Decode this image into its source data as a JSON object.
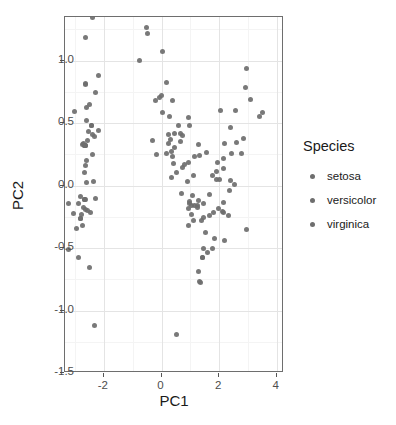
{
  "chart_data": {
    "type": "scatter",
    "title": "",
    "xlabel": "PC1",
    "ylabel": "PC2",
    "xlim": [
      -3.35,
      4.25
    ],
    "ylim": [
      -1.5,
      1.35
    ],
    "xticks": [
      "-2",
      "0",
      "2",
      "4"
    ],
    "xtick_values": [
      -2,
      0,
      2,
      4
    ],
    "yticks": [
      "1.0",
      "0.5",
      "0.0",
      "-0.5",
      "-1.0",
      "-1.5"
    ],
    "ytick_values": [
      1.0,
      0.5,
      0.0,
      -0.5,
      -1.0,
      -1.5
    ],
    "grid": true,
    "legend_position": "right",
    "legend_title": "Species",
    "point_color": "#6e6e6e",
    "panel_background": "#ffffff",
    "grid_color": "#e4e4e4",
    "series": [
      {
        "name": "setosa",
        "color": "#6e6e6e",
        "x": [
          -2.684,
          -2.714,
          -2.889,
          -2.745,
          -2.729,
          -2.28,
          -2.821,
          -2.626,
          -2.887,
          -2.673,
          -2.507,
          -2.613,
          -2.786,
          -3.223,
          -2.644,
          -2.386,
          -2.623,
          -2.648,
          -2.199,
          -2.587,
          -2.31,
          -2.543,
          -3.216,
          -2.303,
          -2.356,
          -2.507,
          -2.469,
          -2.562,
          -2.639,
          -2.633,
          -2.585,
          -2.41,
          -2.642,
          -2.598,
          -2.648,
          -2.946,
          -2.687,
          -2.673,
          -3.051,
          -2.59,
          -2.693,
          -2.326,
          -3.003,
          -2.387,
          -2.203,
          -2.797,
          -2.447,
          -2.797,
          -2.447,
          -2.677
        ],
        "y": [
          0.319,
          -0.177,
          -0.145,
          -0.318,
          0.327,
          0.742,
          -0.089,
          0.164,
          -0.578,
          -0.114,
          0.652,
          0.022,
          -0.235,
          -0.511,
          1.186,
          1.345,
          0.819,
          0.319,
          0.879,
          0.52,
          0.397,
          0.437,
          -0.141,
          -0.105,
          0.033,
          -0.652,
          -0.216,
          0.358,
          0.319,
          -0.19,
          -0.196,
          0.412,
          0.813,
          0.623,
          -0.114,
          -0.347,
          0.32,
          -0.114,
          -0.227,
          0.203,
          0.335,
          -1.121,
          0.591,
          0.252,
          0.443,
          -0.265,
          0.48,
          -0.265,
          0.48,
          0.104
        ]
      },
      {
        "name": "versicolor",
        "color": "#6e6e6e",
        "x": [
          1.284,
          0.932,
          1.462,
          0.181,
          1.089,
          0.641,
          1.095,
          -0.749,
          1.044,
          -0.009,
          -0.51,
          0.511,
          0.265,
          0.985,
          -0.174,
          0.928,
          0.66,
          0.236,
          0.944,
          0.045,
          1.116,
          0.358,
          1.296,
          0.922,
          0.718,
          0.9,
          1.333,
          1.559,
          0.813,
          -0.307,
          -0.07,
          -0.194,
          0.344,
          1.157,
          0.702,
          0.969,
          1.054,
          0.729,
          0.227,
          0.368,
          0.442,
          0.978,
          0.175,
          0.024,
          0.434,
          0.31,
          0.423,
          0.59,
          -0.473,
          0.365
        ],
        "y": [
          -0.685,
          -0.318,
          -0.504,
          0.827,
          -0.075,
          0.419,
          -0.283,
          1.005,
          -0.228,
          0.723,
          1.267,
          0.105,
          0.552,
          -0.124,
          0.251,
          -0.183,
          0.352,
          0.334,
          0.543,
          0.583,
          0.085,
          0.069,
          0.331,
          0.182,
          0.147,
          0.033,
          0.245,
          0.268,
          0.168,
          0.365,
          0.702,
          0.68,
          0.276,
          0.233,
          -0.06,
          -0.146,
          -0.162,
          0.403,
          0.409,
          0.683,
          0.419,
          0.484,
          0.259,
          1.074,
          0.308,
          0.368,
          0.178,
          0.483,
          1.218,
          0.23
        ]
      },
      {
        "name": "virginica",
        "color": "#6e6e6e",
        "x": [
          2.531,
          1.413,
          2.617,
          1.972,
          2.35,
          3.397,
          0.522,
          2.932,
          2.321,
          2.918,
          1.66,
          1.803,
          2.167,
          1.342,
          1.589,
          1.834,
          1.678,
          2.958,
          3.508,
          1.233,
          2.192,
          1.448,
          2.766,
          1.302,
          2.142,
          2.405,
          1.257,
          1.291,
          2.123,
          2.387,
          2.84,
          3.233,
          2.158,
          1.443,
          1.78,
          3.076,
          2.144,
          1.903,
          1.15,
          2.041,
          1.998,
          2.187,
          1.413,
          2.561,
          2.419,
          1.944,
          1.527,
          1.764,
          1.901,
          1.39
        ],
        "y": [
          0.011,
          -0.574,
          0.343,
          -0.18,
          -0.041,
          0.55,
          -1.194,
          -0.355,
          -0.242,
          0.783,
          -0.243,
          -0.217,
          0.215,
          -0.778,
          -0.538,
          -0.423,
          -0.067,
          0.936,
          0.584,
          -0.161,
          -0.438,
          -0.256,
          0.26,
          -0.766,
          -0.137,
          0.04,
          -0.179,
          -0.116,
          -0.21,
          0.464,
          0.377,
          1.374,
          -0.218,
          -0.143,
          -0.5,
          0.689,
          0.14,
          0.05,
          -0.163,
          0.604,
          0.05,
          0.339,
          -0.575,
          0.598,
          0.258,
          0.188,
          -0.375,
          0.078,
          0.116,
          -0.283
        ]
      }
    ]
  },
  "legend": {
    "title": "Species",
    "items": [
      {
        "label": "setosa",
        "color": "#6e6e6e"
      },
      {
        "label": "versicolor",
        "color": "#6e6e6e"
      },
      {
        "label": "virginica",
        "color": "#6e6e6e"
      }
    ]
  },
  "axes": {
    "x_title": "PC1",
    "y_title": "PC2"
  }
}
